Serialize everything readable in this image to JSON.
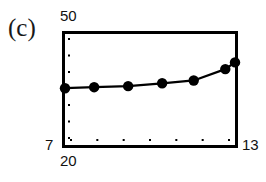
{
  "panel": {
    "label": "(c)"
  },
  "axes": {
    "y_max_label": "50",
    "y_min_label": "7",
    "x_min_label": "20",
    "x_max_label": "13"
  },
  "chart_data": {
    "type": "line",
    "title": "(c)",
    "xlabel": "",
    "ylabel": "",
    "xlim": [
      20,
      13
    ],
    "ylim": [
      7,
      50
    ],
    "x_tick_labels": [
      "20",
      "13"
    ],
    "y_tick_labels": [
      "7",
      "50"
    ],
    "grid": false,
    "legend": "none",
    "n_interior_x_ticks": 7,
    "n_interior_y_ticks": 7,
    "marker": "filled-circle",
    "x": [
      20,
      18.8,
      17.4,
      16.0,
      14.7,
      13.4,
      13.0
    ],
    "values": [
      29.0,
      29.4,
      29.8,
      30.9,
      32.0,
      36.4,
      39.0
    ],
    "series": [
      {
        "name": "series-1",
        "values": [
          29.0,
          29.4,
          29.8,
          30.9,
          32.0,
          36.4,
          39.0
        ]
      }
    ],
    "points": [
      {
        "x": 20.0,
        "y": 29.0
      },
      {
        "x": 18.8,
        "y": 29.4
      },
      {
        "x": 17.4,
        "y": 29.8
      },
      {
        "x": 16.0,
        "y": 30.9
      },
      {
        "x": 14.7,
        "y": 32.0
      },
      {
        "x": 13.4,
        "y": 36.4
      },
      {
        "x": 13.0,
        "y": 39.0
      }
    ],
    "colors": {
      "line": "#000000",
      "marker": "#000000",
      "frame": "#000000",
      "background": "#ffffff"
    }
  }
}
